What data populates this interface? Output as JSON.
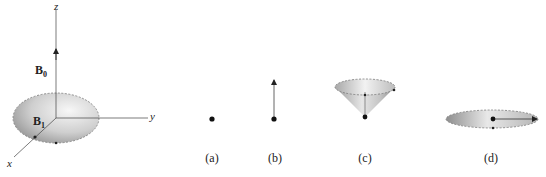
{
  "figure": {
    "axes": {
      "x_label": "x",
      "y_label": "y",
      "z_label": "z"
    },
    "vectors": {
      "b0_label": "B",
      "b0_sub": "0",
      "b1_label": "B",
      "b1_sub": "1"
    },
    "panels": [
      {
        "label": "(a)",
        "description": "magnetization dot only"
      },
      {
        "label": "(b)",
        "description": "vector pointing up along z"
      },
      {
        "label": "(c)",
        "description": "vector precessing on a cone"
      },
      {
        "label": "(d)",
        "description": "vector rotating in transverse plane"
      }
    ],
    "colors": {
      "line": "#333333",
      "disc_light": "#f2f2f2",
      "disc_dark": "#9a9a9a",
      "dash": "#777777"
    }
  }
}
